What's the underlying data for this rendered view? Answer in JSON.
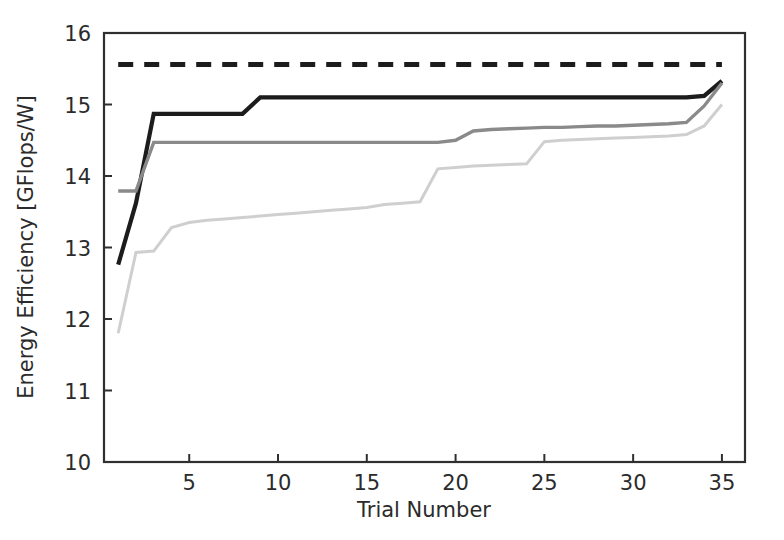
{
  "chart_data": {
    "type": "line",
    "title": "",
    "xlabel": "Trial Number",
    "ylabel": "Energy Efficiency [GFlops/W]",
    "xlim": [
      0.2,
      36.3
    ],
    "ylim": [
      10,
      16
    ],
    "xticks": [
      5,
      10,
      15,
      20,
      25,
      30,
      35
    ],
    "xtick_labels": [
      "5",
      "10",
      "15",
      "20",
      "25",
      "30",
      "35"
    ],
    "yticks": [
      10,
      11,
      12,
      13,
      14,
      15,
      16
    ],
    "ytick_labels": [
      "10",
      "11",
      "12",
      "13",
      "14",
      "15",
      "16"
    ],
    "grid": false,
    "legend": "none",
    "x": [
      1,
      2,
      3,
      4,
      5,
      6,
      7,
      8,
      9,
      10,
      11,
      12,
      13,
      14,
      15,
      16,
      17,
      18,
      19,
      20,
      21,
      22,
      23,
      24,
      25,
      26,
      27,
      28,
      29,
      30,
      31,
      32,
      33,
      34,
      35
    ],
    "series": [
      {
        "name": "reference-dashed",
        "style": "dashed",
        "color": "#1c1c1c",
        "width": 5.0,
        "values": [
          15.56,
          15.56,
          15.56,
          15.56,
          15.56,
          15.56,
          15.56,
          15.56,
          15.56,
          15.56,
          15.56,
          15.56,
          15.56,
          15.56,
          15.56,
          15.56,
          15.56,
          15.56,
          15.56,
          15.56,
          15.56,
          15.56,
          15.56,
          15.56,
          15.56,
          15.56,
          15.56,
          15.56,
          15.56,
          15.56,
          15.56,
          15.56,
          15.56,
          15.56,
          15.56
        ]
      },
      {
        "name": "dark-solid",
        "style": "solid",
        "color": "#1c1c1c",
        "width": 4.2,
        "values": [
          12.76,
          13.62,
          14.87,
          14.87,
          14.87,
          14.87,
          14.87,
          14.87,
          15.1,
          15.1,
          15.1,
          15.1,
          15.1,
          15.1,
          15.1,
          15.1,
          15.1,
          15.1,
          15.1,
          15.1,
          15.1,
          15.1,
          15.1,
          15.1,
          15.1,
          15.1,
          15.1,
          15.1,
          15.1,
          15.1,
          15.1,
          15.1,
          15.1,
          15.12,
          15.33
        ]
      },
      {
        "name": "medium-gray-solid",
        "style": "solid",
        "color": "#8a8a8a",
        "width": 3.4,
        "values": [
          13.79,
          13.79,
          14.47,
          14.47,
          14.47,
          14.47,
          14.47,
          14.47,
          14.47,
          14.47,
          14.47,
          14.47,
          14.47,
          14.47,
          14.47,
          14.47,
          14.47,
          14.47,
          14.47,
          14.5,
          14.63,
          14.65,
          14.66,
          14.67,
          14.68,
          14.68,
          14.69,
          14.7,
          14.7,
          14.71,
          14.72,
          14.73,
          14.75,
          14.98,
          15.3
        ]
      },
      {
        "name": "light-gray-solid",
        "style": "solid",
        "color": "#cfcfcf",
        "width": 3.0,
        "values": [
          11.8,
          12.93,
          12.95,
          13.28,
          13.35,
          13.38,
          13.4,
          13.42,
          13.44,
          13.46,
          13.48,
          13.5,
          13.52,
          13.54,
          13.56,
          13.6,
          13.62,
          13.64,
          14.1,
          14.12,
          14.14,
          14.15,
          14.16,
          14.17,
          14.48,
          14.5,
          14.51,
          14.52,
          14.53,
          14.54,
          14.55,
          14.56,
          14.58,
          14.7,
          15.0
        ]
      }
    ]
  }
}
